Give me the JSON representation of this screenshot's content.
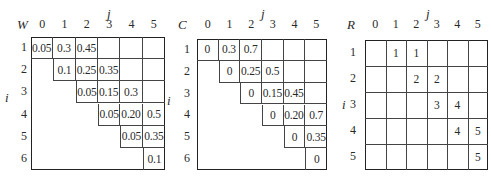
{
  "tables": [
    {
      "name": "W",
      "corner_label": "W",
      "col_axis_label": "j",
      "row_axis_label": "i",
      "columns": [
        "0",
        "1",
        "2",
        "3",
        "4",
        "5"
      ],
      "rows": [
        "1",
        "2",
        "3",
        "4",
        "5",
        "6"
      ],
      "cells": [
        [
          "0.05",
          "0.3",
          "0.45",
          "",
          "",
          ""
        ],
        [
          "",
          "0.1",
          "0.25",
          "0.35",
          "",
          ""
        ],
        [
          "",
          "",
          "0.05",
          "0.15",
          "0.3",
          ""
        ],
        [
          "",
          "",
          "",
          "0.05",
          "0.20",
          "0.5"
        ],
        [
          "",
          "",
          "",
          "",
          "0.05",
          "0.35"
        ],
        [
          "",
          "",
          "",
          "",
          "",
          "0.1"
        ]
      ]
    },
    {
      "name": "C",
      "corner_label": "C",
      "col_axis_label": "j",
      "row_axis_label": "i",
      "columns": [
        "0",
        "1",
        "2",
        "3",
        "4",
        "5"
      ],
      "rows": [
        "1",
        "2",
        "3",
        "4",
        "5",
        "6"
      ],
      "cells": [
        [
          "0",
          "0.3",
          "0.7",
          "",
          "",
          ""
        ],
        [
          "",
          "0",
          "0.25",
          "0.5",
          "",
          ""
        ],
        [
          "",
          "",
          "0",
          "0.15",
          "0.45",
          ""
        ],
        [
          "",
          "",
          "",
          "0",
          "0.20",
          "0.7"
        ],
        [
          "",
          "",
          "",
          "",
          "0",
          "0.35"
        ],
        [
          "",
          "",
          "",
          "",
          "",
          "0"
        ]
      ]
    },
    {
      "name": "R",
      "corner_label": "R",
      "col_axis_label": "j",
      "row_axis_label": "i",
      "columns": [
        "0",
        "1",
        "2",
        "3",
        "4",
        "5"
      ],
      "rows": [
        "1",
        "2",
        "3",
        "4",
        "5"
      ],
      "cells": [
        [
          "",
          "1",
          "1",
          "",
          "",
          ""
        ],
        [
          "",
          "",
          "2",
          "2",
          "",
          ""
        ],
        [
          "",
          "",
          "",
          "3",
          "4",
          ""
        ],
        [
          "",
          "",
          "",
          "",
          "4",
          "5"
        ],
        [
          "",
          "",
          "",
          "",
          "",
          "5"
        ]
      ]
    }
  ]
}
